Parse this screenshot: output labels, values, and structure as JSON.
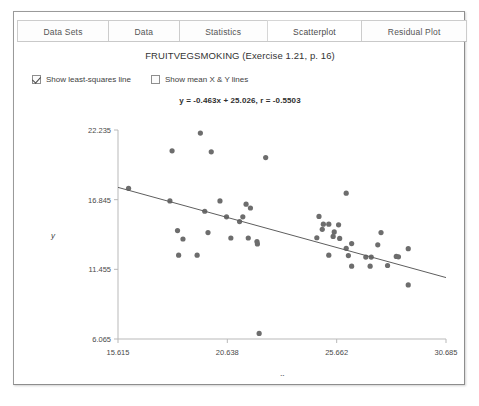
{
  "tabs": [
    {
      "label": "Data Sets",
      "selected": false
    },
    {
      "label": "Data",
      "selected": false
    },
    {
      "label": "Statistics",
      "selected": false
    },
    {
      "label": "Scatterplot",
      "selected": true
    },
    {
      "label": "Residual Plot",
      "selected": false
    }
  ],
  "title": "FRUITVEGSMOKING (Exercise 1.21, p. 16)",
  "options": [
    {
      "label": "Show least-squares line",
      "checked": true
    },
    {
      "label": "Show mean X & Y lines",
      "checked": false
    }
  ],
  "equation": "y = -0.463x + 25.026, r = -0.5503",
  "colors": {
    "point": "#6d6d6d",
    "line": "#5e5e5e",
    "axis": "#b9b9b9",
    "panel_border": "#9a9a9a",
    "tab_border": "#cccccc"
  },
  "chart_data": {
    "type": "scatter",
    "title": "FRUITVEGSMOKING (Exercise 1.21, p. 16)",
    "xlabel": "x",
    "ylabel": "y",
    "grid": false,
    "legend": "none",
    "xlim": [
      15.615,
      30.685
    ],
    "ylim": [
      6.065,
      22.235
    ],
    "xticks": [
      15.615,
      20.638,
      25.662,
      30.685
    ],
    "yticks": [
      6.065,
      11.455,
      16.845,
      22.235
    ],
    "xtick_labels": [
      "15.615",
      "20.638",
      "25.662",
      "30.685"
    ],
    "ytick_labels": [
      "6.065",
      "11.455",
      "16.845",
      "22.235"
    ],
    "annotations": [
      "y = -0.463x + 25.026, r = -0.5503"
    ],
    "fit": {
      "type": "least-squares",
      "slope": -0.463,
      "intercept": 25.026,
      "r": -0.5503,
      "x_start": 15.615,
      "x_end": 30.685,
      "y_start": 17.795,
      "y_end": 10.818
    },
    "points": [
      {
        "x": 16.1,
        "y": 17.72
      },
      {
        "x": 18.1,
        "y": 20.62
      },
      {
        "x": 19.4,
        "y": 22.0
      },
      {
        "x": 19.9,
        "y": 20.55
      },
      {
        "x": 22.4,
        "y": 20.1
      },
      {
        "x": 18.0,
        "y": 16.75
      },
      {
        "x": 20.3,
        "y": 16.75
      },
      {
        "x": 21.5,
        "y": 16.5
      },
      {
        "x": 21.7,
        "y": 16.2
      },
      {
        "x": 19.6,
        "y": 15.95
      },
      {
        "x": 26.1,
        "y": 17.35
      },
      {
        "x": 20.6,
        "y": 15.52
      },
      {
        "x": 21.35,
        "y": 15.52
      },
      {
        "x": 21.2,
        "y": 15.15
      },
      {
        "x": 24.85,
        "y": 15.55
      },
      {
        "x": 25.05,
        "y": 14.95
      },
      {
        "x": 25.3,
        "y": 14.95
      },
      {
        "x": 25.0,
        "y": 14.55
      },
      {
        "x": 25.75,
        "y": 14.9
      },
      {
        "x": 25.55,
        "y": 14.35
      },
      {
        "x": 18.35,
        "y": 14.45
      },
      {
        "x": 19.75,
        "y": 14.3
      },
      {
        "x": 25.5,
        "y": 14.0
      },
      {
        "x": 25.8,
        "y": 13.85
      },
      {
        "x": 27.7,
        "y": 14.3
      },
      {
        "x": 20.8,
        "y": 13.88
      },
      {
        "x": 21.6,
        "y": 13.88
      },
      {
        "x": 24.75,
        "y": 13.9
      },
      {
        "x": 18.6,
        "y": 13.8
      },
      {
        "x": 22.0,
        "y": 13.6
      },
      {
        "x": 22.02,
        "y": 13.42
      },
      {
        "x": 26.35,
        "y": 13.45
      },
      {
        "x": 26.1,
        "y": 13.08
      },
      {
        "x": 27.55,
        "y": 13.35
      },
      {
        "x": 28.95,
        "y": 13.05
      },
      {
        "x": 18.4,
        "y": 12.55
      },
      {
        "x": 19.25,
        "y": 12.55
      },
      {
        "x": 25.3,
        "y": 12.55
      },
      {
        "x": 26.2,
        "y": 12.52
      },
      {
        "x": 27.0,
        "y": 12.4
      },
      {
        "x": 27.25,
        "y": 12.4
      },
      {
        "x": 28.4,
        "y": 12.45
      },
      {
        "x": 28.5,
        "y": 12.42
      },
      {
        "x": 26.35,
        "y": 11.7
      },
      {
        "x": 27.2,
        "y": 11.7
      },
      {
        "x": 28.0,
        "y": 11.75
      },
      {
        "x": 28.95,
        "y": 10.25
      },
      {
        "x": 22.1,
        "y": 6.5
      }
    ]
  }
}
